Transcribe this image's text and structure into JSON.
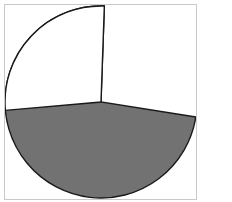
{
  "figure": {
    "title": "",
    "background_color": "#ffffff",
    "frame_color": "#c9c9c9"
  },
  "chart_data": {
    "type": "pie",
    "title": "",
    "subtitle": "",
    "xlabel": "",
    "ylabel": "",
    "legend": false,
    "legend_position": "none",
    "grid": false,
    "labels": [
      "Slice 1",
      "Slice 2"
    ],
    "values": [
      73,
      27
    ],
    "percentages": [
      "73%",
      "27%"
    ],
    "colors": [
      "#727272",
      "#ffffff"
    ],
    "edge_color": "#1a1a1a",
    "edge_width": 1.4,
    "start_angle_deg": 88,
    "direction": "counterclockwise",
    "slices": [
      {
        "label": "Slice 1",
        "value": 73,
        "percent": "73%",
        "color": "#727272",
        "start_angle_deg": 88,
        "end_angle_deg": -175,
        "sweep_deg": 263
      },
      {
        "label": "Slice 2",
        "value": 27,
        "percent": "27%",
        "color": "#ffffff",
        "start_angle_deg": 88,
        "end_angle_deg": 185,
        "sweep_deg": 97
      }
    ],
    "geometry": {
      "center_x": 96,
      "center_y": 97,
      "radius": 96
    }
  }
}
